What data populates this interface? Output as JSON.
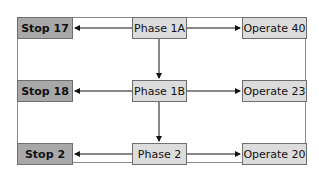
{
  "diagram": {
    "rows": [
      {
        "stop": "Stop 17",
        "phase": "Phase 1A",
        "operate": "Operate 40"
      },
      {
        "stop": "Stop 18",
        "phase": "Phase 1B",
        "operate": "Operate 23"
      },
      {
        "stop": "Stop 2",
        "phase": "Phase 2",
        "operate": "Operate 20"
      }
    ],
    "colors": {
      "stop_fill": "#a8a8a8",
      "phase_fill": "#dcdcdc",
      "operate_fill": "#dcdcdc",
      "border": "#6e6e6e"
    }
  }
}
